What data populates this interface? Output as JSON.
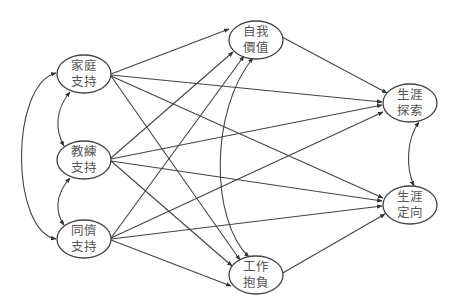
{
  "diagram": {
    "type": "path-model",
    "nodes": [
      {
        "id": "family",
        "line1": "家庭",
        "line2": "支持",
        "cx": 84,
        "cy": 74
      },
      {
        "id": "coach",
        "line1": "教練",
        "line2": "支持",
        "cx": 84,
        "cy": 160
      },
      {
        "id": "peer",
        "line1": "同儕",
        "line2": "支持",
        "cx": 84,
        "cy": 239
      },
      {
        "id": "selfworth",
        "line1": "自我",
        "line2": "價值",
        "cx": 256,
        "cy": 40
      },
      {
        "id": "aspiration",
        "line1": "工作",
        "line2": "抱負",
        "cx": 256,
        "cy": 275
      },
      {
        "id": "exploration",
        "line1": "生涯",
        "line2": "探索",
        "cx": 410,
        "cy": 103
      },
      {
        "id": "orientation",
        "line1": "生涯",
        "line2": "定向",
        "cx": 410,
        "cy": 205
      }
    ],
    "directed_edges": [
      {
        "from": "family",
        "to": "selfworth"
      },
      {
        "from": "family",
        "to": "aspiration"
      },
      {
        "from": "family",
        "to": "exploration"
      },
      {
        "from": "family",
        "to": "orientation"
      },
      {
        "from": "coach",
        "to": "selfworth"
      },
      {
        "from": "coach",
        "to": "aspiration"
      },
      {
        "from": "coach",
        "to": "exploration"
      },
      {
        "from": "coach",
        "to": "orientation"
      },
      {
        "from": "peer",
        "to": "selfworth"
      },
      {
        "from": "peer",
        "to": "aspiration"
      },
      {
        "from": "peer",
        "to": "exploration"
      },
      {
        "from": "peer",
        "to": "orientation"
      },
      {
        "from": "selfworth",
        "to": "exploration"
      },
      {
        "from": "aspiration",
        "to": "orientation"
      }
    ],
    "correlations": [
      {
        "between": [
          "family",
          "coach"
        ]
      },
      {
        "between": [
          "coach",
          "peer"
        ]
      },
      {
        "between": [
          "family",
          "peer"
        ]
      },
      {
        "between": [
          "selfworth",
          "aspiration"
        ]
      },
      {
        "between": [
          "exploration",
          "orientation"
        ]
      }
    ]
  }
}
